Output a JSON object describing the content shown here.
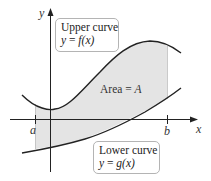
{
  "diagram": {
    "colors": {
      "shading": "#e4e4e4",
      "curve": "#222222",
      "axis": "#222222",
      "box_border": "#b4b4b4",
      "text": "#222222"
    },
    "axes": {
      "x_label": "x",
      "y_label": "y"
    },
    "bounds": {
      "left_label": "a",
      "right_label": "b"
    },
    "upper_curve": {
      "title": "Upper curve",
      "equation_lhs": "y",
      "equation_eq": " = ",
      "equation_fn": "f",
      "equation_arg": "(x)"
    },
    "lower_curve": {
      "title": "Lower curve",
      "equation_lhs": "y",
      "equation_eq": " = ",
      "equation_fn": "g",
      "equation_arg": "(x)"
    },
    "region": {
      "label_prefix": "Area = ",
      "label_var": "A"
    }
  }
}
